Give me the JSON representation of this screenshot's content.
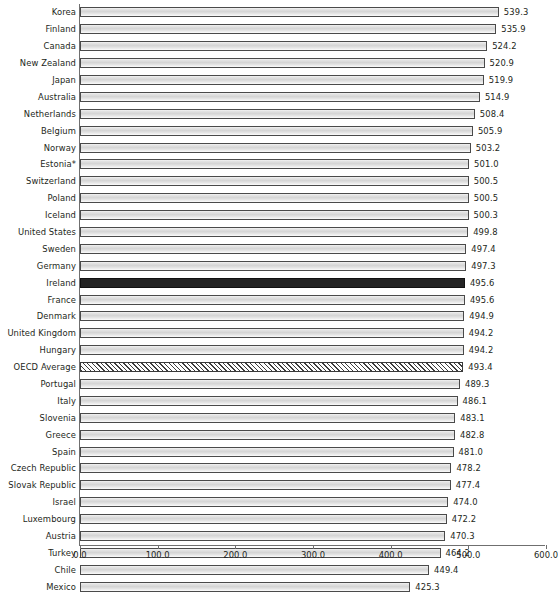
{
  "chart_data": {
    "type": "bar",
    "orientation": "horizontal",
    "title": "",
    "subtitle": "",
    "xlabel": "",
    "ylabel": "",
    "xlim": [
      0.0,
      600.0
    ],
    "xticks": [
      "0.0",
      "100.0",
      "200.0",
      "300.0",
      "400.0",
      "500.0",
      "600.0"
    ],
    "xtick_values": [
      0,
      100,
      200,
      300,
      400,
      500,
      600
    ],
    "grid": false,
    "legend_position": "none",
    "categories": [
      "Korea",
      "Finland",
      "Canada",
      "New Zealand",
      "Japan",
      "Australia",
      "Netherlands",
      "Belgium",
      "Norway",
      "Estonia*",
      "Switzerland",
      "Poland",
      "Iceland",
      "United States",
      "Sweden",
      "Germany",
      "Ireland",
      "France",
      "Denmark",
      "United Kingdom",
      "Hungary",
      "OECD Average",
      "Portugal",
      "Italy",
      "Slovenia",
      "Greece",
      "Spain",
      "Czech Republic",
      "Slovak Republic",
      "Israel",
      "Luxembourg",
      "Austria",
      "Turkey",
      "Chile",
      "Mexico"
    ],
    "values": [
      539.3,
      535.9,
      524.2,
      520.9,
      519.9,
      514.9,
      508.4,
      505.9,
      503.2,
      501.0,
      500.5,
      500.5,
      500.3,
      499.8,
      497.4,
      497.3,
      495.6,
      495.6,
      494.9,
      494.2,
      494.2,
      493.4,
      489.3,
      486.1,
      483.1,
      482.8,
      481.0,
      478.2,
      477.4,
      474.0,
      472.2,
      470.3,
      464.2,
      449.4,
      425.3
    ],
    "value_labels": [
      "539.3",
      "535.9",
      "524.2",
      "520.9",
      "519.9",
      "514.9",
      "508.4",
      "505.9",
      "503.2",
      "501.0",
      "500.5",
      "500.5",
      "500.3",
      "499.8",
      "497.4",
      "497.3",
      "495.6",
      "495.6",
      "494.9",
      "494.2",
      "494.2",
      "493.4",
      "489.3",
      "486.1",
      "483.1",
      "482.8",
      "481.0",
      "478.2",
      "477.4",
      "474.0",
      "472.2",
      "470.3",
      "464.2",
      "449.4",
      "425.3"
    ],
    "highlight_category": "Ireland",
    "hatched_category": "OECD Average",
    "colors": {
      "bar_fill": "#d5d5d5",
      "bar_edge": "#4a4a4a",
      "highlight_fill": "#242424",
      "hatch_stroke": "#3d3d3d",
      "axis": "#6f6f6f",
      "text": "#231f20",
      "background": "#ffffff"
    }
  }
}
